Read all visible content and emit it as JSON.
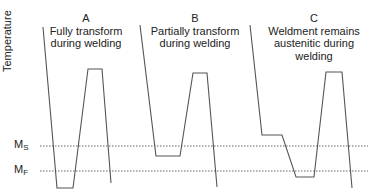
{
  "diagram": {
    "y_axis_label": "Temperature",
    "reference_lines": [
      {
        "id": "ms",
        "label": "M",
        "subscript": "S",
        "y": 146
      },
      {
        "id": "mf",
        "label": "M",
        "subscript": "F",
        "y": 171
      }
    ],
    "cases": [
      {
        "letter": "A",
        "caption_lines": [
          "Fully transform",
          "during welding"
        ],
        "points": "43,27 57,188 73,188 88,69 102,69 111,183"
      },
      {
        "letter": "B",
        "caption_lines": [
          "Partially transform",
          "during welding"
        ],
        "points": "140,25 156,156 180,156 193,73 207,73 217,187"
      },
      {
        "letter": "C",
        "caption_lines": [
          "Weldment remains",
          "austenitic during",
          "welding"
        ],
        "points": "250,25 262,135 282,135 296,177 314,177 326,72 342,72 352,188"
      }
    ],
    "colors": {
      "curve": "#555555",
      "dashed": "#555555",
      "text": "#222222"
    }
  }
}
